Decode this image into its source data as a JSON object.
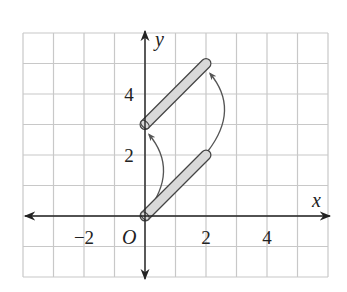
{
  "diagram": {
    "type": "coordinate-plane-translation",
    "grid": {
      "x_min": -4,
      "x_max": 6,
      "y_min": -2,
      "y_max": 6,
      "step": 1
    },
    "axes": {
      "x_label": "x",
      "y_label": "y",
      "origin_label": "O",
      "x_ticks": [
        {
          "value": -2,
          "label": "−2"
        },
        {
          "value": 2,
          "label": "2"
        },
        {
          "value": 4,
          "label": "4"
        }
      ],
      "y_ticks": [
        {
          "value": 2,
          "label": "2"
        },
        {
          "value": 4,
          "label": "4"
        }
      ]
    },
    "figures": [
      {
        "name": "original-rod",
        "from": [
          0,
          0
        ],
        "to": [
          2,
          2
        ]
      },
      {
        "name": "translated-rod",
        "from": [
          0,
          3
        ],
        "to": [
          2,
          5
        ]
      }
    ],
    "translation_arrows": [
      {
        "from": [
          0,
          0
        ],
        "to": [
          0,
          3
        ]
      },
      {
        "from": [
          2,
          2
        ],
        "to": [
          2,
          5
        ]
      }
    ],
    "colors": {
      "grid": "#c8c8c8",
      "axis": "#222222",
      "rod_fill": "#d9d9d9",
      "rod_outline": "#444444",
      "arrow": "#555555"
    }
  }
}
